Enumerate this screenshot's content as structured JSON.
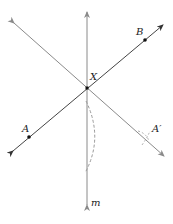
{
  "diagram": {
    "labels": {
      "X": "X",
      "A": "A",
      "B": "B",
      "A_prime": "A′",
      "m": "m"
    },
    "colors": {
      "line": "#8a8a8a",
      "dark_line": "#3a3a3a",
      "point": "#111111",
      "arc": "#9a9a9a"
    }
  }
}
